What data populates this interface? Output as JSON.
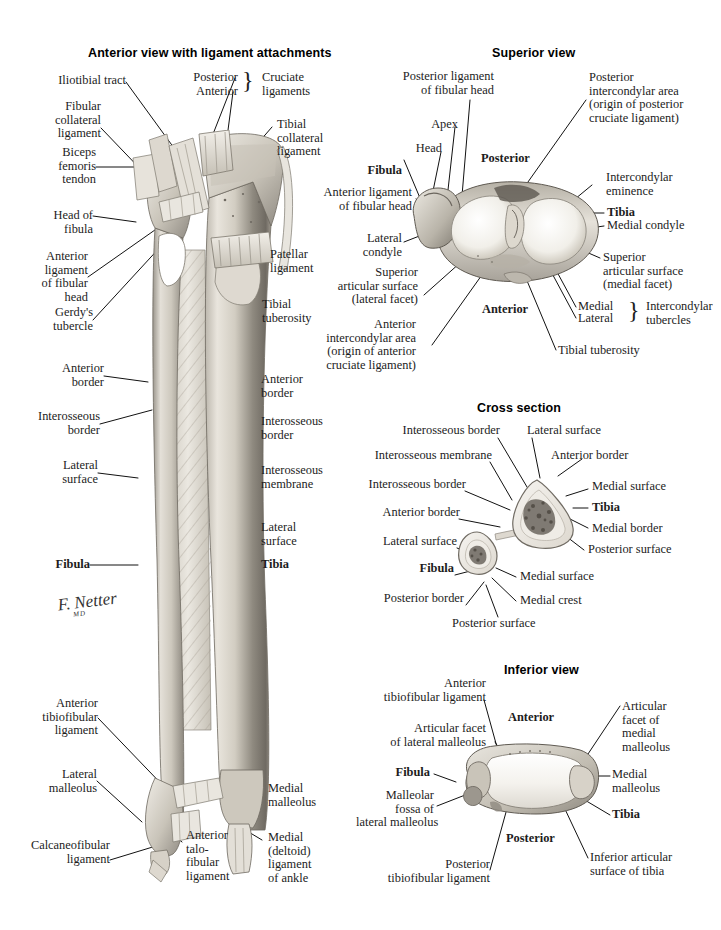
{
  "page": {
    "background": "#ffffff",
    "signature": "F. Netter",
    "signature_sub": "MD"
  },
  "panels": {
    "anterior": {
      "title": "Anterior view with ligament attachments",
      "labels": {
        "iliotibial_tract": "Iliotibial tract",
        "fibular_collateral_ligament": "Fibular\ncollateral\nligament",
        "biceps_femoris_tendon": "Biceps\nfemoris\ntendon",
        "head_of_fibula": "Head of\nfibula",
        "anterior_ligament_of_fibular_head": "Anterior\nligament\nof fibular\nhead",
        "gerdys_tubercle": "Gerdy's\ntubercle",
        "anterior_border_left": "Anterior\nborder",
        "interosseous_border_left": "Interosseous\nborder",
        "lateral_surface_left": "Lateral\nsurface",
        "fibula": "Fibula",
        "anterior_tibiofibular_ligament": "Anterior\ntibiofibular\nligament",
        "lateral_malleolus": "Lateral\nmalleolus",
        "calcaneofibular_ligament": "Calcaneofibular\nligament",
        "posterior_cruciate": "Posterior",
        "anterior_cruciate": "Anterior",
        "cruciate_ligaments": "Cruciate\nligaments",
        "tibial_collateral_ligament": "Tibial\ncollateral\nligament",
        "patellar_ligament": "Patellar\nligament",
        "tibial_tuberosity": "Tibial\ntuberosity",
        "anterior_border_right": "Anterior\nborder",
        "interosseous_border_right": "Interosseous\nborder",
        "interosseous_membrane": "Interosseous\nmembrane",
        "lateral_surface_right": "Lateral\nsurface",
        "tibia": "Tibia",
        "anterior_talofibular_ligament": "Anterior\ntalo-\nfibular\nligament",
        "medial_malleolus": "Medial\nmalleolus",
        "medial_deltoid_ligament": "Medial\n(deltoid)\nligament\nof ankle"
      }
    },
    "superior": {
      "title": "Superior view",
      "labels": {
        "posterior_ligament_of_fibular_head": "Posterior ligament\nof fibular head",
        "apex": "Apex",
        "head": "Head",
        "fibula": "Fibula",
        "anterior_ligament_of_fibular_head": "Anterior ligament\nof fibular head",
        "lateral_condyle": "Lateral\ncondyle",
        "superior_articular_surface_lateral": "Superior\narticular surface\n(lateral facet)",
        "anterior_intercondylar_area": "Anterior\nintercondylar area\n(origin of anterior\ncruciate ligament)",
        "posterior": "Posterior",
        "anterior": "Anterior",
        "posterior_intercondylar_area": "Posterior\nintercondylar area\n(origin of posterior\ncruciate ligament)",
        "intercondylar_eminence": "Intercondylar\neminence",
        "tibia": "Tibia",
        "medial_condyle": "Medial condyle",
        "superior_articular_surface_medial": "Superior\narticular surface\n(medial facet)",
        "medial_tubercle": "Medial",
        "lateral_tubercle": "Lateral",
        "intercondylar_tubercles": "Intercondylar\ntubercles",
        "tibial_tuberosity": "Tibial tuberosity"
      }
    },
    "cross_section": {
      "title": "Cross section",
      "labels": {
        "interosseous_border_top": "Interosseous border",
        "interosseous_membrane": "Interosseous membrane",
        "interosseous_border_mid": "Interosseous border",
        "anterior_border_left": "Anterior border",
        "lateral_surface_left": "Lateral surface",
        "fibula": "Fibula",
        "posterior_border": "Posterior border",
        "posterior_surface_bottom": "Posterior surface",
        "lateral_surface_top": "Lateral surface",
        "anterior_border_right": "Anterior border",
        "medial_surface_tibia": "Medial surface",
        "tibia": "Tibia",
        "medial_border": "Medial border",
        "posterior_surface_tibia": "Posterior surface",
        "medial_surface_fibula": "Medial surface",
        "medial_crest": "Medial crest"
      }
    },
    "inferior": {
      "title": "Inferior view",
      "labels": {
        "anterior_tibiofibular_ligament": "Anterior\ntibiofibular ligament",
        "articular_facet_of_lateral_malleolus": "Articular facet\nof lateral malleolus",
        "fibula": "Fibula",
        "malleolar_fossa": "Malleolar\nfossa of\nlateral malleolus",
        "posterior_tibiofibular_ligament": "Posterior\ntibiofibular ligament",
        "anterior": "Anterior",
        "posterior": "Posterior",
        "articular_facet_of_medial_malleolus": "Articular\nfacet of\nmedial\nmalleolus",
        "medial_malleolus": "Medial\nmalleolus",
        "tibia": "Tibia",
        "inferior_articular_surface_of_tibia": "Inferior articular\nsurface of tibia"
      }
    }
  }
}
